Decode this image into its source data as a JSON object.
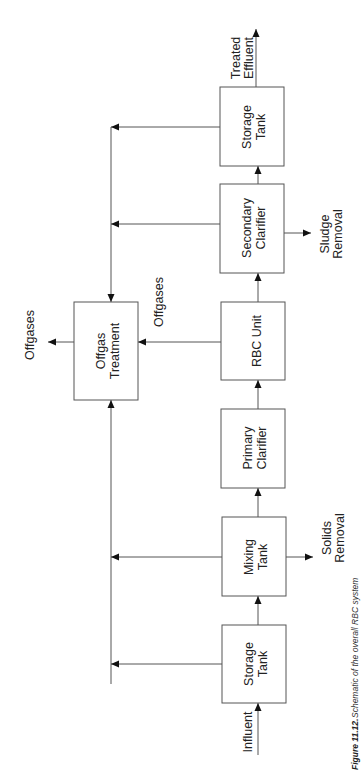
{
  "figure": {
    "number": "Figure 11.12.",
    "caption": "Schematic of the overall RBC system",
    "orientation": "rotated 90° counter-clockwise"
  },
  "process_units": [
    {
      "id": "storage-tank-in",
      "line1": "Storage",
      "line2": "Tank"
    },
    {
      "id": "mixing-tank",
      "line1": "Mixing",
      "line2": "Tank"
    },
    {
      "id": "primary-clarifier",
      "line1": "Primary",
      "line2": "Clarifier"
    },
    {
      "id": "rbc-unit",
      "line1": "RBC Unit",
      "line2": ""
    },
    {
      "id": "secondary-clarifier",
      "line1": "Secondary",
      "line2": "Clarifier"
    },
    {
      "id": "storage-tank-out",
      "line1": "Storage",
      "line2": "Tank"
    },
    {
      "id": "offgas-treatment",
      "line1": "Offgas",
      "line2": "Treatment"
    }
  ],
  "streams": {
    "influent": "Influent",
    "treated_effluent": {
      "line1": "Treated",
      "line2": "Effluent"
    },
    "solids_removal": {
      "line1": "Solids",
      "line2": "Removal"
    },
    "sludge_removal": {
      "line1": "Sludge",
      "line2": "Removal"
    },
    "offgases_rbc": "Offgases",
    "offgases_out": "Offgases"
  },
  "flow_sequence": [
    "Influent",
    "Storage Tank",
    "Mixing Tank",
    "Primary Clarifier",
    "RBC Unit",
    "Secondary Clarifier",
    "Storage Tank",
    "Treated Effluent"
  ],
  "colors": {
    "line": "#555555",
    "arrowhead": "#111111",
    "text": "#222222",
    "background": "#ffffff"
  }
}
